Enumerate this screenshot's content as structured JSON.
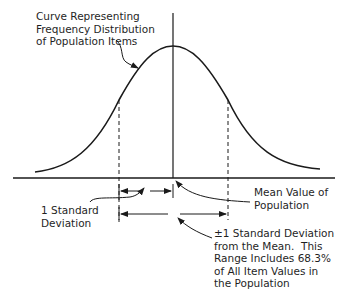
{
  "diagram": {
    "labels": {
      "curve": "Curve Representing\nFrequency Distribution\nof Population Items",
      "mean": "Mean Value of\nPopulation",
      "one_sd": "1 Standard\nDeviation",
      "range": "±1 Standard Deviation\nfrom the Mean.  This\nRange Includes 68.3%\nof All Item Values in\nthe Population"
    },
    "range_percent": "68.3%",
    "stroke_color": "#1a1a1a",
    "background": "#ffffff"
  }
}
